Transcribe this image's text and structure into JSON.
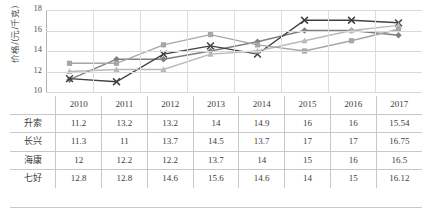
{
  "chart_data": {
    "type": "line",
    "title": "",
    "xlabel": "",
    "ylabel": "价格/(元/千克)",
    "categories": [
      "2010",
      "2011",
      "2012",
      "2013",
      "2014",
      "2015",
      "2016",
      "2017"
    ],
    "ylim": [
      10,
      18
    ],
    "yticks": [
      10,
      12,
      14,
      16,
      18
    ],
    "grid": true,
    "legend": "none",
    "series": [
      {
        "name": "升索",
        "marker": "diamond",
        "color": "#7f7f7f",
        "values": [
          11.2,
          13.2,
          13.2,
          14,
          14.9,
          16,
          16,
          15.54
        ]
      },
      {
        "name": "长兴",
        "marker": "x",
        "color": "#404040",
        "values": [
          11.3,
          11,
          13.7,
          14.5,
          13.7,
          17,
          17,
          16.75
        ]
      },
      {
        "name": "海康",
        "marker": "triangle",
        "color": "#b9b9b9",
        "values": [
          12,
          12.2,
          12.2,
          13.7,
          14,
          15,
          16,
          16.5
        ]
      },
      {
        "name": "七好",
        "marker": "square",
        "color": "#a6a6a6",
        "values": [
          12.8,
          12.8,
          14.6,
          15.6,
          14.6,
          14,
          15,
          16.12
        ]
      }
    ]
  },
  "axis": {
    "y_title": "价格/(元/千克)",
    "y_tick_labels": [
      "18",
      "16",
      "14",
      "12",
      "10"
    ]
  },
  "table": {
    "corner_label": "",
    "columns": [
      "2010",
      "2011",
      "2012",
      "2013",
      "2014",
      "2015",
      "2016",
      "2017"
    ],
    "rows": [
      {
        "label": "升索",
        "values": [
          "11.2",
          "13.2",
          "13.2",
          "14",
          "14.9",
          "16",
          "16",
          "15.54"
        ]
      },
      {
        "label": "长兴",
        "values": [
          "11.3",
          "11",
          "13.7",
          "14.5",
          "13.7",
          "17",
          "17",
          "16.75"
        ]
      },
      {
        "label": "海康",
        "values": [
          "12",
          "12.2",
          "12.2",
          "13.7",
          "14",
          "15",
          "16",
          "16.5"
        ]
      },
      {
        "label": "七好",
        "values": [
          "12.8",
          "12.8",
          "14.6",
          "15.6",
          "14.6",
          "14",
          "15",
          "16.12"
        ]
      }
    ]
  }
}
